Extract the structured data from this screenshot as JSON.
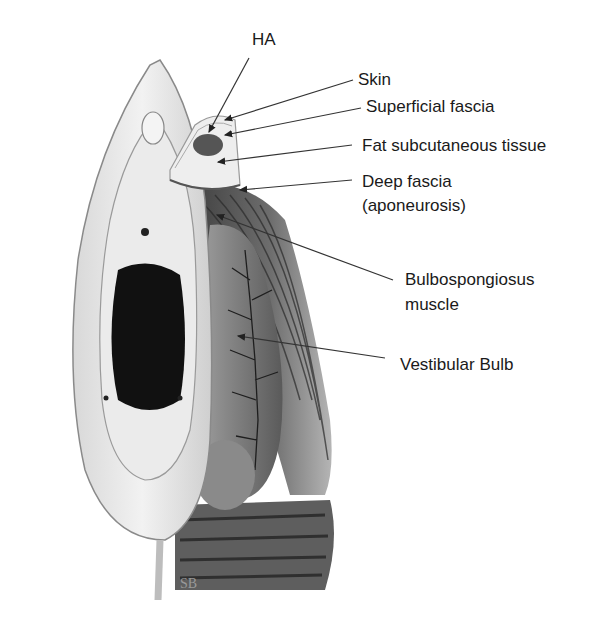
{
  "figure": {
    "labels": {
      "ha": "HA",
      "skin": "Skin",
      "superficial_fascia": "Superficial fascia",
      "fat_subcutaneous": "Fat subcutaneous tissue",
      "deep_fascia_1": "Deep fascia",
      "deep_fascia_2": "(aponeurosis)",
      "bulbospongiosus_1": "Bulbospongiosus",
      "bulbospongiosus_2": "muscle",
      "vestibular_bulb": "Vestibular Bulb"
    },
    "colors": {
      "line": "#333333",
      "tissue_light": "#e6e6e6",
      "tissue_mid": "#9a9a9a",
      "tissue_dark": "#3a3a3a",
      "ha_fill": "#555555"
    }
  }
}
